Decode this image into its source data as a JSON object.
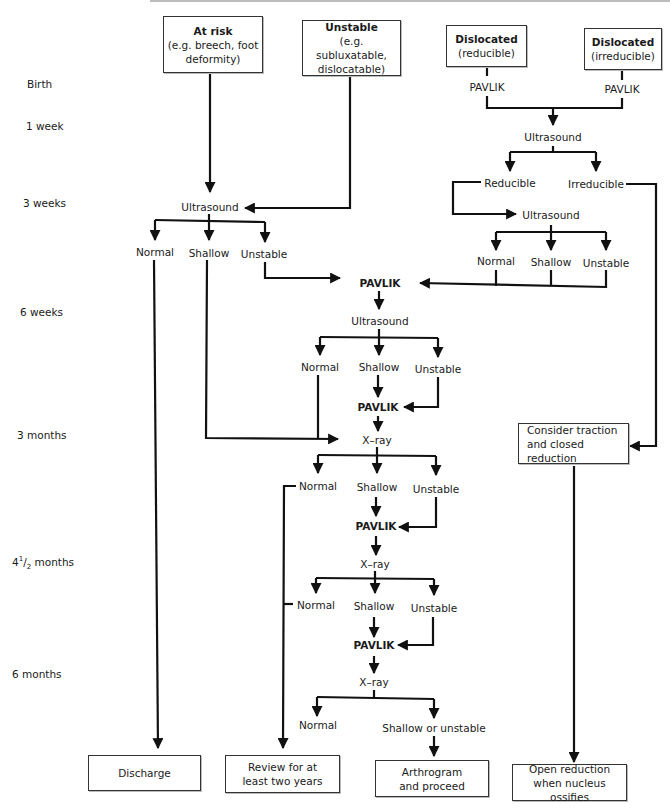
{
  "diagram": {
    "type": "flowchart"
  },
  "timeline": [
    {
      "label": "Birth",
      "y": 84
    },
    {
      "label": "1 week",
      "y": 126
    },
    {
      "label": "3 weeks",
      "y": 203
    },
    {
      "label": "6 weeks",
      "y": 312
    },
    {
      "label": "3 months",
      "y": 435
    },
    {
      "label_main": "4",
      "label_sup": "1",
      "label_sub": "2",
      "label_rest": " months",
      "y": 563
    },
    {
      "label": "6 months",
      "y": 674
    }
  ],
  "entry_boxes": {
    "at_risk": {
      "title": "At risk",
      "line1": "(e.g. breech, foot",
      "line2": "deformity)"
    },
    "unstable": {
      "title": "Unstable",
      "line1": "(e.g. subluxatable,",
      "line2": "dislocatable)"
    },
    "dislocated_reducible": {
      "title": "Dislocated",
      "line1": "(reducible)"
    },
    "dislocated_irreducible": {
      "title": "Dislocated",
      "line1": "(irreducible)"
    }
  },
  "nodes": {
    "pavlik_reducible": "PAVLIK",
    "pavlik_irreducible": "PAVLIK",
    "us_1week": "Ultrasound",
    "reducible": "Reducible",
    "irreducible": "Irreducible",
    "us_3weeks_left": "Ultrasound",
    "us_3weeks_right": "Ultrasound",
    "l3w_normal": "Normal",
    "l3w_shallow": "Shallow",
    "l3w_unstable": "Unstable",
    "r3w_normal": "Normal",
    "r3w_shallow": "Shallow",
    "r3w_unstable": "Unstable",
    "pavlik_6w": "PAVLIK",
    "us_6w": "Ultrasound",
    "w6_normal": "Normal",
    "w6_shallow": "Shallow",
    "w6_unstable": "Unstable",
    "pavlik_6w_b": "PAVLIK",
    "xray_3m": "X–ray",
    "m3_normal": "Normal",
    "m3_shallow": "Shallow",
    "m3_unstable": "Unstable",
    "pavlik_3m": "PAVLIK",
    "xray_45m": "X–ray",
    "m45_normal": "Normal",
    "m45_shallow": "Shallow",
    "m45_unstable": "Unstable",
    "pavlik_45m": "PAVLIK",
    "xray_6m": "X–ray",
    "m6_normal": "Normal",
    "m6_shallow_unstable": "Shallow or unstable",
    "traction": {
      "line1": "Consider traction",
      "line2": "and closed reduction"
    }
  },
  "outcome_boxes": {
    "discharge": {
      "line1": "Discharge"
    },
    "review": {
      "line1": "Review for at",
      "line2": "least two years"
    },
    "arthrogram": {
      "line1": "Arthrogram",
      "line2": "and proceed"
    },
    "open_reduction": {
      "line1": "Open reduction",
      "line2": "when nucleus ossifies"
    }
  },
  "colors": {
    "line": "#111111",
    "box_border": "#333333",
    "background": "#ffffff"
  }
}
